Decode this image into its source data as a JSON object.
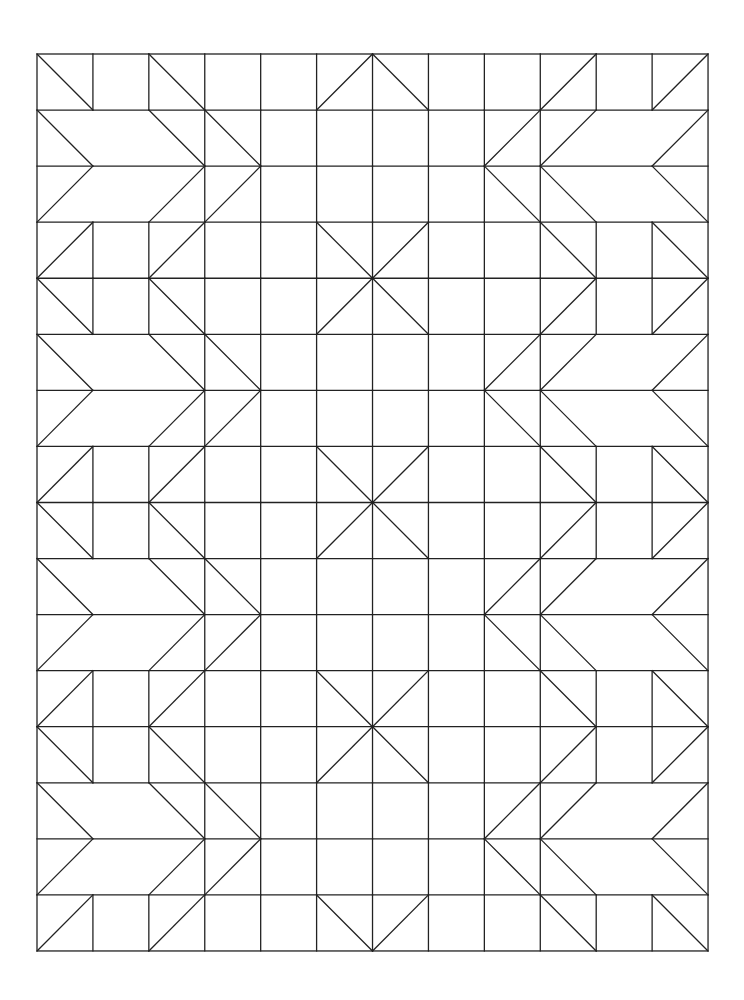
{
  "title": "",
  "pattern": {
    "origin": [
      37,
      54
    ],
    "cell_w": 55.92,
    "cell_h": 56.06,
    "cols": 12,
    "rows": 16,
    "line_color": "#222222",
    "background": "#ffffff",
    "missing_vertical_cols": [
      1,
      2,
      10,
      11
    ],
    "chevron_rows": [
      1,
      2,
      5,
      6,
      9,
      10,
      13,
      14
    ],
    "diagonals": [
      [
        [
          0,
          0
        ],
        [
          1,
          1
        ]
      ],
      [
        [
          2,
          0
        ],
        [
          3,
          1
        ]
      ],
      [
        [
          12,
          0
        ],
        [
          11,
          1
        ]
      ],
      [
        [
          10,
          0
        ],
        [
          9,
          1
        ]
      ],
      [
        [
          6,
          0
        ],
        [
          5,
          1
        ]
      ],
      [
        [
          6,
          0
        ],
        [
          7,
          1
        ]
      ],
      [
        [
          0,
          1
        ],
        [
          1,
          2
        ]
      ],
      [
        [
          1,
          2
        ],
        [
          0,
          3
        ]
      ],
      [
        [
          2,
          1
        ],
        [
          3,
          2
        ]
      ],
      [
        [
          3,
          2
        ],
        [
          2,
          3
        ]
      ],
      [
        [
          3,
          1
        ],
        [
          4,
          2
        ]
      ],
      [
        [
          4,
          2
        ],
        [
          3,
          3
        ]
      ],
      [
        [
          12,
          1
        ],
        [
          11,
          2
        ]
      ],
      [
        [
          11,
          2
        ],
        [
          12,
          3
        ]
      ],
      [
        [
          10,
          1
        ],
        [
          9,
          2
        ]
      ],
      [
        [
          9,
          2
        ],
        [
          10,
          3
        ]
      ],
      [
        [
          9,
          1
        ],
        [
          8,
          2
        ]
      ],
      [
        [
          8,
          2
        ],
        [
          9,
          3
        ]
      ],
      [
        [
          1,
          3
        ],
        [
          0,
          4
        ]
      ],
      [
        [
          3,
          3
        ],
        [
          2,
          4
        ]
      ],
      [
        [
          9,
          3
        ],
        [
          10,
          4
        ]
      ],
      [
        [
          11,
          3
        ],
        [
          12,
          4
        ]
      ],
      [
        [
          5,
          3
        ],
        [
          6,
          4
        ]
      ],
      [
        [
          7,
          3
        ],
        [
          6,
          4
        ]
      ],
      [
        [
          5,
          5
        ],
        [
          6,
          4
        ]
      ],
      [
        [
          7,
          5
        ],
        [
          6,
          4
        ]
      ],
      [
        [
          0,
          4
        ],
        [
          1,
          5
        ]
      ],
      [
        [
          2,
          4
        ],
        [
          3,
          5
        ]
      ],
      [
        [
          12,
          4
        ],
        [
          11,
          5
        ]
      ],
      [
        [
          10,
          4
        ],
        [
          9,
          5
        ]
      ],
      [
        [
          0,
          5
        ],
        [
          1,
          6
        ]
      ],
      [
        [
          1,
          6
        ],
        [
          0,
          7
        ]
      ],
      [
        [
          2,
          5
        ],
        [
          3,
          6
        ]
      ],
      [
        [
          3,
          6
        ],
        [
          2,
          7
        ]
      ],
      [
        [
          3,
          5
        ],
        [
          4,
          6
        ]
      ],
      [
        [
          4,
          6
        ],
        [
          3,
          7
        ]
      ],
      [
        [
          12,
          5
        ],
        [
          11,
          6
        ]
      ],
      [
        [
          11,
          6
        ],
        [
          12,
          7
        ]
      ],
      [
        [
          10,
          5
        ],
        [
          9,
          6
        ]
      ],
      [
        [
          9,
          6
        ],
        [
          10,
          7
        ]
      ],
      [
        [
          9,
          5
        ],
        [
          8,
          6
        ]
      ],
      [
        [
          8,
          6
        ],
        [
          9,
          7
        ]
      ],
      [
        [
          1,
          7
        ],
        [
          0,
          8
        ]
      ],
      [
        [
          3,
          7
        ],
        [
          2,
          8
        ]
      ],
      [
        [
          9,
          7
        ],
        [
          10,
          8
        ]
      ],
      [
        [
          11,
          7
        ],
        [
          12,
          8
        ]
      ],
      [
        [
          5,
          7
        ],
        [
          6,
          8
        ]
      ],
      [
        [
          7,
          7
        ],
        [
          6,
          8
        ]
      ],
      [
        [
          5,
          9
        ],
        [
          6,
          8
        ]
      ],
      [
        [
          7,
          9
        ],
        [
          6,
          8
        ]
      ],
      [
        [
          0,
          8
        ],
        [
          1,
          9
        ]
      ],
      [
        [
          2,
          8
        ],
        [
          3,
          9
        ]
      ],
      [
        [
          12,
          8
        ],
        [
          11,
          9
        ]
      ],
      [
        [
          10,
          8
        ],
        [
          9,
          9
        ]
      ],
      [
        [
          0,
          9
        ],
        [
          1,
          10
        ]
      ],
      [
        [
          1,
          10
        ],
        [
          0,
          11
        ]
      ],
      [
        [
          2,
          9
        ],
        [
          3,
          10
        ]
      ],
      [
        [
          3,
          10
        ],
        [
          2,
          11
        ]
      ],
      [
        [
          3,
          9
        ],
        [
          4,
          10
        ]
      ],
      [
        [
          4,
          10
        ],
        [
          3,
          11
        ]
      ],
      [
        [
          12,
          9
        ],
        [
          11,
          10
        ]
      ],
      [
        [
          11,
          10
        ],
        [
          12,
          11
        ]
      ],
      [
        [
          10,
          9
        ],
        [
          9,
          10
        ]
      ],
      [
        [
          9,
          10
        ],
        [
          10,
          11
        ]
      ],
      [
        [
          9,
          9
        ],
        [
          8,
          10
        ]
      ],
      [
        [
          8,
          10
        ],
        [
          9,
          11
        ]
      ],
      [
        [
          1,
          11
        ],
        [
          0,
          12
        ]
      ],
      [
        [
          3,
          11
        ],
        [
          2,
          12
        ]
      ],
      [
        [
          9,
          11
        ],
        [
          10,
          12
        ]
      ],
      [
        [
          11,
          11
        ],
        [
          12,
          12
        ]
      ],
      [
        [
          5,
          11
        ],
        [
          6,
          12
        ]
      ],
      [
        [
          7,
          11
        ],
        [
          6,
          12
        ]
      ],
      [
        [
          5,
          13
        ],
        [
          6,
          12
        ]
      ],
      [
        [
          7,
          13
        ],
        [
          6,
          12
        ]
      ],
      [
        [
          0,
          12
        ],
        [
          1,
          13
        ]
      ],
      [
        [
          2,
          12
        ],
        [
          3,
          13
        ]
      ],
      [
        [
          12,
          12
        ],
        [
          11,
          13
        ]
      ],
      [
        [
          10,
          12
        ],
        [
          9,
          13
        ]
      ],
      [
        [
          0,
          13
        ],
        [
          1,
          14
        ]
      ],
      [
        [
          1,
          14
        ],
        [
          0,
          15
        ]
      ],
      [
        [
          2,
          13
        ],
        [
          3,
          14
        ]
      ],
      [
        [
          3,
          14
        ],
        [
          2,
          15
        ]
      ],
      [
        [
          3,
          13
        ],
        [
          4,
          14
        ]
      ],
      [
        [
          4,
          14
        ],
        [
          3,
          15
        ]
      ],
      [
        [
          12,
          13
        ],
        [
          11,
          14
        ]
      ],
      [
        [
          11,
          14
        ],
        [
          12,
          15
        ]
      ],
      [
        [
          10,
          13
        ],
        [
          9,
          14
        ]
      ],
      [
        [
          9,
          14
        ],
        [
          10,
          15
        ]
      ],
      [
        [
          9,
          13
        ],
        [
          8,
          14
        ]
      ],
      [
        [
          8,
          14
        ],
        [
          9,
          15
        ]
      ],
      [
        [
          1,
          15
        ],
        [
          0,
          16
        ]
      ],
      [
        [
          3,
          15
        ],
        [
          2,
          16
        ]
      ],
      [
        [
          9,
          15
        ],
        [
          10,
          16
        ]
      ],
      [
        [
          11,
          15
        ],
        [
          12,
          16
        ]
      ],
      [
        [
          5,
          15
        ],
        [
          6,
          16
        ]
      ],
      [
        [
          7,
          15
        ],
        [
          6,
          16
        ]
      ]
    ]
  }
}
